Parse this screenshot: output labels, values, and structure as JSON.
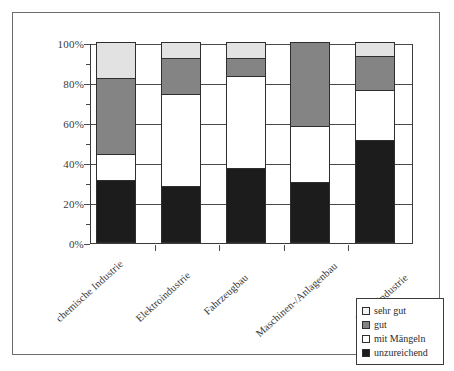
{
  "chart_data": {
    "type": "bar",
    "subtype": "stacked-100-percent",
    "title": "",
    "xlabel": "",
    "ylabel": "",
    "ylim": [
      0,
      100
    ],
    "ytick_labels": [
      "0%",
      "20%",
      "40%",
      "60%",
      "80%",
      "100%"
    ],
    "ytick_values": [
      0,
      20,
      40,
      60,
      80,
      100
    ],
    "minor_ticks": [
      10,
      30,
      50,
      70,
      90
    ],
    "grid": true,
    "legend_position": "bottom-right",
    "categories": [
      "chemische Industrie",
      "Elektroindustrie",
      "Fahrzeugbau",
      "Maschinen-/Anlagenbau",
      "Metallindustrie"
    ],
    "series": [
      {
        "name": "unzureichend",
        "color": "#1c1c1c",
        "values": [
          31,
          28,
          37,
          30,
          51
        ]
      },
      {
        "name": "mit Mängeln",
        "color": "#ffffff",
        "values": [
          13,
          46,
          46,
          28,
          25
        ]
      },
      {
        "name": "gut",
        "color": "#848484",
        "values": [
          38,
          18,
          9,
          42,
          17
        ]
      },
      {
        "name": "sehr gut",
        "color": "#e2e2e2",
        "values": [
          18,
          8,
          8,
          0,
          7
        ]
      }
    ],
    "cumulative_tops": {
      "chemische Industrie": {
        "unzureichend": 31,
        "mit Mängeln": 44,
        "gut": 82,
        "sehr gut": 100
      },
      "Elektroindustrie": {
        "unzureichend": 28,
        "mit Mängeln": 74,
        "gut": 92,
        "sehr gut": 100
      },
      "Fahrzeugbau": {
        "unzureichend": 37,
        "mit Mängeln": 83,
        "gut": 92,
        "sehr gut": 100
      },
      "Maschinen-/Anlagenbau": {
        "unzureichend": 30,
        "mit Mängeln": 58,
        "gut": 100,
        "sehr gut": 100
      },
      "Metallindustrie": {
        "unzureichend": 51,
        "mit Mängeln": 76,
        "gut": 93,
        "sehr gut": 100
      }
    }
  },
  "axis": {
    "y_labels": [
      "100%",
      "80%",
      "60%",
      "40%",
      "20%",
      "0%"
    ]
  },
  "categories": [
    {
      "label": "chemische Industrie"
    },
    {
      "label": "Elektroindustrie"
    },
    {
      "label": "Fahrzeugbau"
    },
    {
      "label": "Maschinen-/Anlagenbau"
    },
    {
      "label": "Metallindustrie"
    }
  ],
  "legend": {
    "items": [
      {
        "label": "sehr gut",
        "key": "sehr-gut",
        "color": "#e2e2e2"
      },
      {
        "label": "gut",
        "key": "gut",
        "color": "#848484"
      },
      {
        "label": "mit Mängeln",
        "key": "mit-maengeln",
        "color": "#ffffff"
      },
      {
        "label": "unzureichend",
        "key": "unzureichend",
        "color": "#1c1c1c"
      }
    ]
  }
}
